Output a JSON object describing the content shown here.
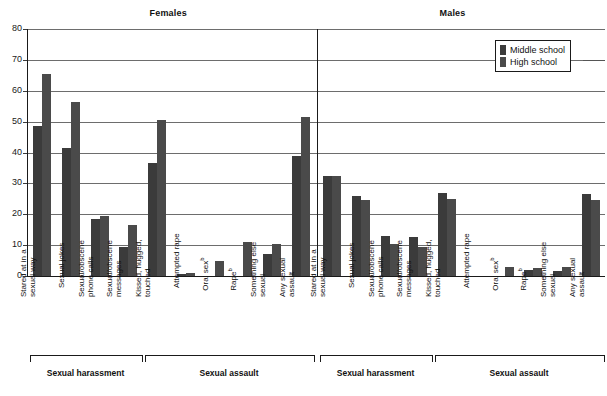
{
  "panels": [
    {
      "key": "females",
      "title": "Females"
    },
    {
      "key": "males",
      "title": "Males"
    }
  ],
  "legend": {
    "title": "",
    "items": [
      {
        "label": "Middle school",
        "color": "#3b3b3b"
      },
      {
        "label": "High school",
        "color": "#4a4a4a"
      }
    ]
  },
  "axis": {
    "y_ticks": [
      "0",
      "10",
      "20",
      "30",
      "40",
      "50",
      "60",
      "70",
      "80"
    ],
    "y_min": 0,
    "y_max": 80
  },
  "groups": [
    {
      "label": "Sexual harassment"
    },
    {
      "label": "Sexual assault"
    }
  ],
  "categories": [
    {
      "line1": "Stared at in a",
      "line2": "sexual way",
      "sup": "",
      "group": 0
    },
    {
      "line1": "Sexual jokes",
      "line2": "",
      "sup": "",
      "group": 0
    },
    {
      "line1": "Sexual/obscene",
      "line2": "phone calls",
      "sup": "",
      "group": 0
    },
    {
      "line1": "Sexual/obscene",
      "line2": "messages",
      "sup": "",
      "group": 0
    },
    {
      "line1": "Kissed, hugged,",
      "line2": "touched",
      "sup": "",
      "group": 1
    },
    {
      "line1": "Attempted rape",
      "line2": "",
      "sup": "",
      "group": 1
    },
    {
      "line1": "Oral sex",
      "line2": "",
      "sup": "b",
      "group": 1
    },
    {
      "line1": "Rape",
      "line2": "",
      "sup": "b",
      "group": 1
    },
    {
      "line1": "Something else",
      "line2": "sexual",
      "sup": "",
      "group": 1
    },
    {
      "line1": "Any sexual",
      "line2": "assault",
      "sup": "",
      "group": 1
    }
  ],
  "chart_data": {
    "type": "bar",
    "title": "",
    "xlabel": "",
    "ylabel": "",
    "ylim": [
      0,
      80
    ],
    "ytick_step": 10,
    "grid": true,
    "legend_position": "top-right",
    "panels": [
      {
        "name": "Females",
        "categories": [
          "Stared at in a sexual way",
          "Sexual jokes",
          "Sexual/obscene phone calls",
          "Sexual/obscene messages",
          "Kissed, hugged, touched",
          "Attempted rape",
          "Oral sex",
          "Rape",
          "Something else sexual",
          "Any sexual assault"
        ],
        "series": [
          {
            "name": "Middle school",
            "values": [
              48.5,
              41.5,
              18.5,
              9.5,
              36.5,
              0.7,
              0,
              0,
              7,
              39
            ]
          },
          {
            "name": "High school",
            "values": [
              65.5,
              56.5,
              19.5,
              16.5,
              50.5,
              1.0,
              5,
              11,
              10.5,
              51.5
            ]
          }
        ]
      },
      {
        "name": "Males",
        "categories": [
          "Stared at in a sexual way",
          "Sexual jokes",
          "Sexual/obscene phone calls",
          "Sexual/obscene messages",
          "Kissed, hugged, touched",
          "Attempted rape",
          "Oral sex",
          "Rape",
          "Something else sexual",
          "Any sexual assault"
        ],
        "series": [
          {
            "name": "Middle school",
            "values": [
              32.5,
              26,
              13,
              12.5,
              27,
              0,
              0,
              2,
              1.5,
              26.5
            ]
          },
          {
            "name": "High school",
            "values": [
              32.5,
              24.5,
              10.5,
              9.5,
              25,
              0,
              3,
              2.5,
              3,
              24.5
            ]
          }
        ]
      }
    ],
    "groups": [
      {
        "label": "Sexual harassment",
        "categories": [
          0,
          1,
          2,
          3
        ]
      },
      {
        "label": "Sexual assault",
        "categories": [
          4,
          5,
          6,
          7,
          8,
          9
        ]
      }
    ]
  }
}
